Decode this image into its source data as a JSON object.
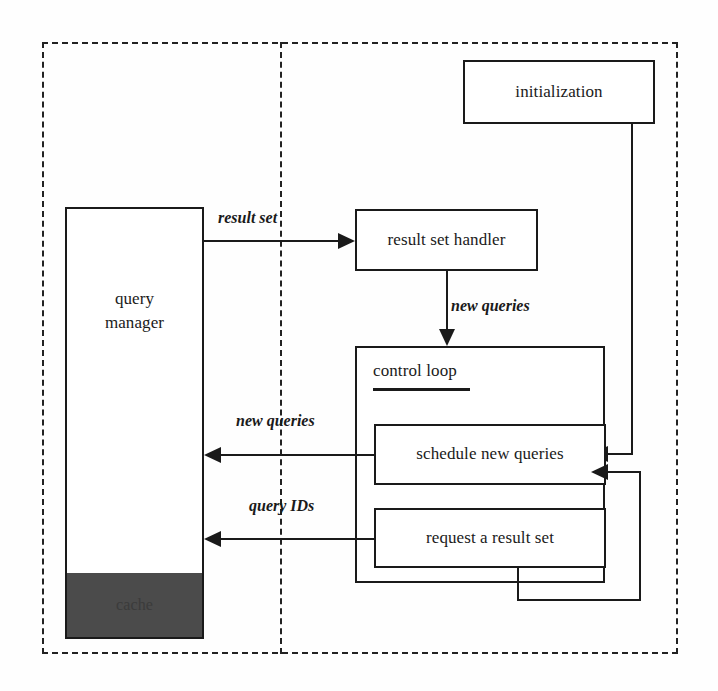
{
  "diagram": {
    "stroke_color": "#1a1a1a",
    "cache_fill_color": "#4b4b4b",
    "background_color": "#fefefe"
  },
  "boundaries": {
    "outer": "system boundary (dashed)",
    "divider": "client / server split (dashed vertical)"
  },
  "nodes": {
    "initialization": "initialization",
    "query_manager": "query\nmanager",
    "query_manager_line1": "query",
    "query_manager_line2": "manager",
    "cache": "cache",
    "result_set_handler": "result set handler",
    "control_loop": "control loop",
    "schedule_new_queries": "schedule new queries",
    "request_a_result_set": "request a result set"
  },
  "edges": [
    {
      "name": "result-set",
      "label": "result set",
      "from": "query_manager",
      "to": "result_set_handler",
      "direction": "right"
    },
    {
      "name": "new-queries-down",
      "label": "new queries",
      "from": "result_set_handler",
      "to": "control_loop",
      "direction": "down"
    },
    {
      "name": "new-queries-left",
      "label": "new queries",
      "from": "schedule_new_queries",
      "to": "query_manager",
      "direction": "left"
    },
    {
      "name": "query-ids",
      "label": "query IDs",
      "from": "request_a_result_set",
      "to": "query_manager",
      "direction": "left"
    },
    {
      "name": "initialization-to-schedule",
      "label": "",
      "from": "initialization",
      "to": "schedule_new_queries",
      "direction": "left"
    },
    {
      "name": "loop-feedback-to-schedule",
      "label": "",
      "from": "request_a_result_set",
      "to": "schedule_new_queries",
      "direction": "left"
    }
  ],
  "edge_labels": {
    "result_set": "result set",
    "new_queries_down": "new queries",
    "new_queries_left": "new queries",
    "query_ids": "query IDs"
  }
}
